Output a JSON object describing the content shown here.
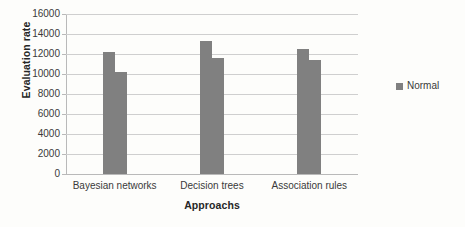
{
  "chart_data": {
    "type": "bar",
    "title": "",
    "xlabel": "Approachs",
    "ylabel": "Evaluation rate",
    "categories": [
      "Bayesian networks",
      "Decision trees",
      "Association rules"
    ],
    "series": [
      {
        "name": "Normal",
        "values": [
          12200,
          13300,
          12500
        ]
      },
      {
        "name": "Normal",
        "values": [
          10200,
          11600,
          11400
        ]
      }
    ],
    "ylim": [
      0,
      16000
    ],
    "ytick_step": 2000,
    "yticks": [
      "16000",
      "14000",
      "12000",
      "10000",
      "8000",
      "6000",
      "4000",
      "2000",
      "0"
    ],
    "ytick_values": [
      16000,
      14000,
      12000,
      10000,
      8000,
      6000,
      4000,
      2000,
      0
    ],
    "grid": true,
    "legend": {
      "position": "right",
      "entries": [
        "Normal"
      ]
    },
    "colors": {
      "bar": "#808080",
      "gridline": "#cfcfcf",
      "axis": "#b9b9b9",
      "text": "#3a3a3a",
      "background": "#fdfdfb"
    }
  }
}
